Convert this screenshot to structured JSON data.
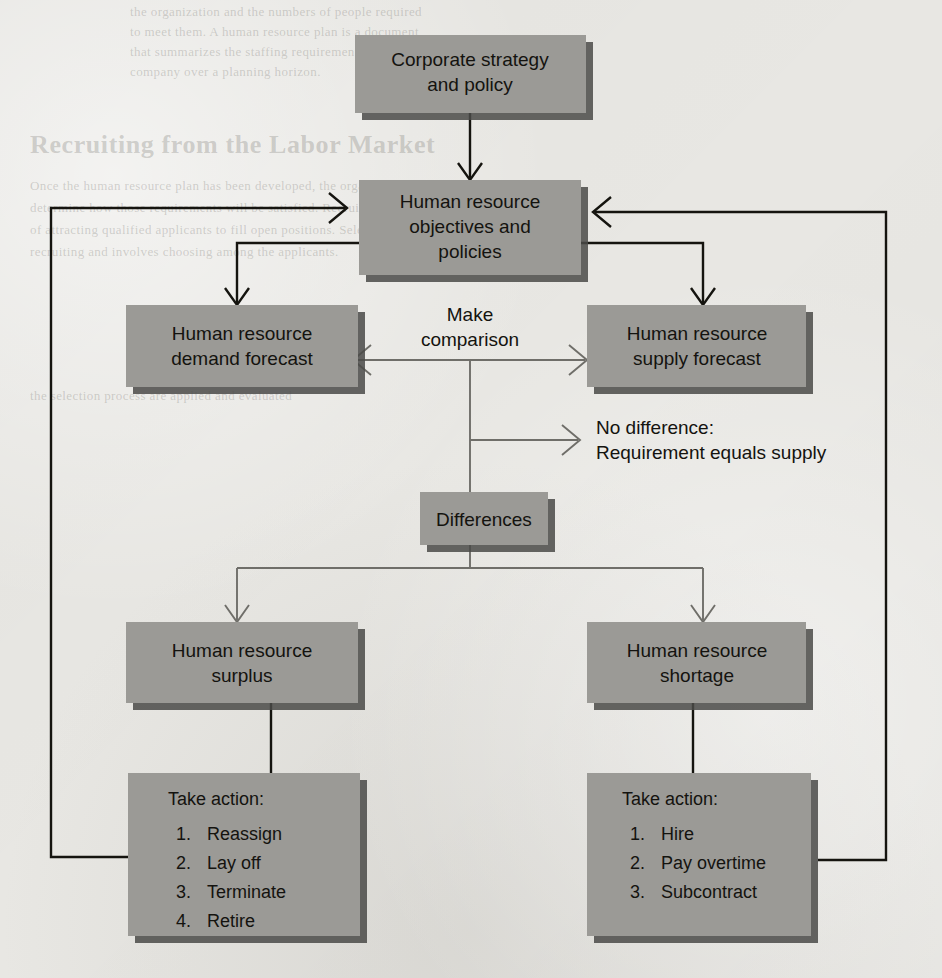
{
  "diagram": {
    "colors": {
      "page_background": "#e8e7e3",
      "box_fill": "#9b9a96",
      "box_shadow": "#4a4a48",
      "text": "#14130f",
      "dark_connector": "#15140f",
      "light_connector": "#6f6e69"
    },
    "boxes": {
      "corporate": {
        "line1": "Corporate strategy",
        "line2": "and policy"
      },
      "objectives": {
        "line1": "Human resource",
        "line2": "objectives and",
        "line3": "policies"
      },
      "demand": {
        "line1": "Human resource",
        "line2": "demand forecast"
      },
      "supply": {
        "line1": "Human resource",
        "line2": "supply forecast"
      },
      "differences": {
        "line1": "Differences"
      },
      "surplus": {
        "line1": "Human resource",
        "line2": "surplus"
      },
      "shortage": {
        "line1": "Human resource",
        "line2": "shortage"
      },
      "surplus_actions": {
        "heading": "Take action:",
        "items": [
          {
            "num": "1.",
            "text": "Reassign"
          },
          {
            "num": "2.",
            "text": "Lay off"
          },
          {
            "num": "3.",
            "text": "Terminate"
          },
          {
            "num": "4.",
            "text": "Retire"
          }
        ]
      },
      "shortage_actions": {
        "heading": "Take action:",
        "items": [
          {
            "num": "1.",
            "text": "Hire"
          },
          {
            "num": "2.",
            "text": "Pay overtime"
          },
          {
            "num": "3.",
            "text": "Subcontract"
          }
        ]
      }
    },
    "labels": {
      "comparison_line1": "Make",
      "comparison_line2": "comparison",
      "no_difference_line1": "No difference:",
      "no_difference_line2": "Requirement equals supply"
    }
  },
  "background_bleed": {
    "top_lines": [
      "the organization and the numbers of people required",
      "to meet them. A human resource plan is a document",
      "that summarizes the staffing requirements of a",
      "company over a planning horizon."
    ],
    "heading": "Recruiting from the Labor Market",
    "mid_lines": [
      "Once the human resource plan has been developed, the organization must",
      "determine how those requirements will be satisfied. Recruiting is the process",
      "of attracting qualified applicants to fill open positions. Selection follows",
      "recruiting and involves choosing among the applicants.",
      "",
      "the selection process are applied and evaluated"
    ]
  }
}
